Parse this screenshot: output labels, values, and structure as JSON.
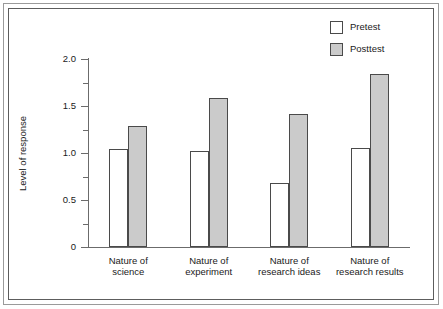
{
  "chart_data": {
    "type": "bar",
    "title": "",
    "xlabel": "",
    "ylabel": "Level of response",
    "ylim": [
      0,
      2.0
    ],
    "grid": false,
    "legend_position": "top-right",
    "ytick_labels": [
      "2.0",
      "1.5",
      "1.0",
      "0.5",
      "0"
    ],
    "ytick_values": [
      2.0,
      1.5,
      1.0,
      0.5,
      0
    ],
    "minor_tick_interval": 0.25,
    "categories": [
      "Nature of science",
      "Nature of experiment",
      "Nature of research ideas",
      "Nature of research results"
    ],
    "category_lines": [
      [
        "Nature of",
        "science"
      ],
      [
        "Nature of",
        "experiment"
      ],
      [
        "Nature of",
        "research ideas"
      ],
      [
        "Nature of",
        "research results"
      ]
    ],
    "series": [
      {
        "name": "Pretest",
        "color": "#ffffff",
        "values": [
          1.04,
          1.02,
          0.68,
          1.05
        ]
      },
      {
        "name": "Posttest",
        "color": "#cbcbcb",
        "values": [
          1.29,
          1.58,
          1.41,
          1.84
        ]
      }
    ]
  },
  "legend": {
    "items": [
      {
        "label": "Pretest"
      },
      {
        "label": "Posttest"
      }
    ]
  },
  "colors": {
    "pretest_fill": "#ffffff",
    "posttest_fill": "#cbcbcb",
    "bar_outline": "#4a4a4a",
    "axis": "#6b6b6b",
    "text": "#1a1a1a",
    "frame_outer": "#9a9a9a",
    "frame_inner": "#5d5d5d",
    "background": "#ffffff"
  }
}
